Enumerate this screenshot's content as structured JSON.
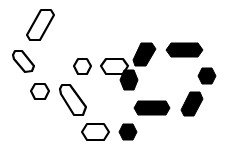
{
  "canvas": {
    "width": 228,
    "height": 152,
    "background": "#ffffff",
    "ink": "#000000"
  },
  "shapes": [
    {
      "name": "outline-slanted-hex-top-left",
      "style": "outline",
      "points": "41,10 51,10 54,15 40,40 30,40 27,35"
    },
    {
      "name": "outline-hex-left",
      "style": "outline",
      "points": "15,51 22,51 34,66 32,71 25,72 14,59 13,55"
    },
    {
      "name": "outline-small-hex-center",
      "style": "outline",
      "points": "78,59 87,59 91,66 87,74 78,74 74,66"
    },
    {
      "name": "outline-wide-hex-center",
      "style": "outline",
      "points": "106,59 123,59 128,66 123,74 106,74 101,66"
    },
    {
      "name": "filled-slanted-hex-upper",
      "style": "filled",
      "points": "141,43 152,43 156,49 146,66 135,66 133,60"
    },
    {
      "name": "filled-wide-hex-upper-right",
      "style": "filled",
      "points": "171,43 198,43 203,50 198,57 171,57 166,50"
    },
    {
      "name": "filled-small-hex-mid",
      "style": "filled",
      "points": "124,70 134,70 138,80 134,90 124,90 120,80"
    },
    {
      "name": "filled-small-hex-right",
      "style": "filled",
      "points": "202,68 212,68 216,76 212,84 202,84 198,76"
    },
    {
      "name": "outline-small-hex-left-lower",
      "style": "outline",
      "points": "35,84 45,84 49,91 45,99 35,99 31,91"
    },
    {
      "name": "outline-slanted-hex-lower",
      "style": "outline",
      "points": "62,85 70,85 86,107 83,115 74,115 61,94 60,89"
    },
    {
      "name": "filled-wide-hex-lower",
      "style": "filled",
      "points": "138,101 166,101 170,108 166,115 138,115 134,108"
    },
    {
      "name": "filled-slanted-hex-lower-right",
      "style": "filled",
      "points": "190,92 200,92 203,99 194,116 184,116 181,110"
    },
    {
      "name": "outline-wide-hex-bottom",
      "style": "outline",
      "points": "87,124 104,124 109,132 104,140 87,140 82,132"
    },
    {
      "name": "filled-small-hex-bottom",
      "style": "filled",
      "points": "123,124 133,124 137,132 133,140 123,140 119,132"
    }
  ]
}
